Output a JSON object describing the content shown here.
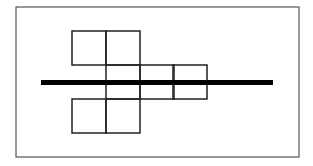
{
  "diagram": {
    "type": "geometric-net-with-axis",
    "frame": {
      "x": 16,
      "y": 7,
      "width": 283,
      "height": 150,
      "stroke": "#555555",
      "stroke_width": 1.2
    },
    "square_size": 34,
    "square_stroke": "#222222",
    "square_stroke_width": 1.5,
    "squares": [
      {
        "row": "top",
        "x": 72,
        "y": 31
      },
      {
        "row": "top",
        "x": 106,
        "y": 31
      },
      {
        "row": "middle",
        "x": 106,
        "y": 65
      },
      {
        "row": "middle",
        "x": 140,
        "y": 65
      },
      {
        "row": "middle",
        "x": 173,
        "y": 65
      },
      {
        "row": "bottom",
        "x": 72,
        "y": 99
      },
      {
        "row": "bottom",
        "x": 106,
        "y": 99
      }
    ],
    "axis_line": {
      "x1": 41,
      "y1": 82.5,
      "x2": 273,
      "y2": 82.5,
      "stroke": "#000000",
      "stroke_width": 5
    }
  }
}
